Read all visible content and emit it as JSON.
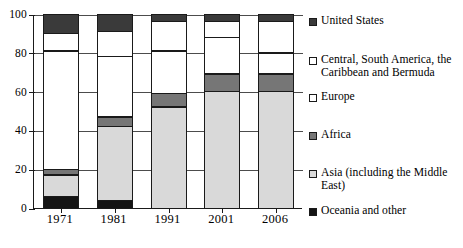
{
  "chart_data": {
    "type": "bar",
    "subtype": "stacked-percentage",
    "title": "",
    "xlabel": "",
    "ylabel": "",
    "categories": [
      "1971",
      "1981",
      "1991",
      "2001",
      "2006"
    ],
    "ylim": [
      0,
      100
    ],
    "yticks": [
      0,
      20,
      40,
      60,
      80,
      100
    ],
    "ytick_labels": [
      "0",
      "20",
      "40",
      "60",
      "80",
      "100"
    ],
    "grid": true,
    "grid_axis": "y",
    "legend_position": "right",
    "stack_order_bottom_to_top": [
      "Oceania and other",
      "Asia (including the Middle East)",
      "Africa",
      "Europe",
      "Central, South America, the Caribbean and Bermuda",
      "United States"
    ],
    "series": [
      {
        "name": "Oceania and other",
        "color": "#141414",
        "values": [
          6,
          4,
          0,
          0,
          0
        ]
      },
      {
        "name": "Asia (including the Middle East)",
        "color": "#d9d9d9",
        "values": [
          11,
          38,
          52,
          60,
          60
        ]
      },
      {
        "name": "Africa",
        "color": "#767676",
        "values": [
          3,
          5,
          7,
          9,
          9
        ]
      },
      {
        "name": "Europe",
        "color": "#ffffff",
        "values": [
          61,
          31,
          22,
          19,
          11
        ]
      },
      {
        "name": "Central, South America, the Caribbean and Bermuda",
        "color": "#ffffff",
        "values": [
          9,
          13,
          15,
          8,
          16
        ]
      },
      {
        "name": "United States",
        "color": "#3a3a3a",
        "values": [
          10,
          9,
          4,
          4,
          4
        ]
      }
    ],
    "cumulative_boundaries": {
      "1971": [
        0,
        6,
        17,
        20,
        81,
        90,
        100
      ],
      "1981": [
        0,
        4,
        42,
        47,
        78,
        91,
        100
      ],
      "1991": [
        0,
        0,
        52,
        59,
        81,
        96,
        100
      ],
      "2001": [
        0,
        0,
        60,
        69,
        88,
        96,
        100
      ],
      "2006": [
        0,
        0,
        60,
        69,
        80,
        96,
        100
      ]
    }
  },
  "legend": {
    "items": [
      {
        "label": "United States",
        "swatch": "dark-gray-swatch",
        "color": "#3a3a3a",
        "top": 4
      },
      {
        "label": "Central, South America, the Caribbean and Bermuda",
        "swatch": "white-swatch",
        "color": "#ffffff",
        "top": 43
      },
      {
        "label": "Europe",
        "swatch": "white-swatch",
        "color": "#ffffff",
        "top": 80
      },
      {
        "label": "Africa",
        "swatch": "medium-gray-swatch",
        "color": "#767676",
        "top": 118
      },
      {
        "label": "Asia (including the Middle East)",
        "swatch": "light-gray-swatch",
        "color": "#d9d9d9",
        "top": 156
      },
      {
        "label": "Oceania and other",
        "swatch": "black-swatch",
        "color": "#141414",
        "top": 194
      }
    ]
  },
  "axis": {
    "y_labels": [
      "100",
      "80",
      "60",
      "40",
      "20",
      "0"
    ],
    "x_labels": [
      "1971",
      "1981",
      "1991",
      "2001",
      "2006"
    ]
  },
  "colors": {
    "united_states": "#3a3a3a",
    "central_south_america": "#ffffff",
    "europe": "#ffffff",
    "africa": "#767676",
    "asia": "#d9d9d9",
    "oceania": "#141414",
    "axis": "#1a1a1a",
    "grid": "#4c4c4c",
    "background": "#ffffff"
  }
}
